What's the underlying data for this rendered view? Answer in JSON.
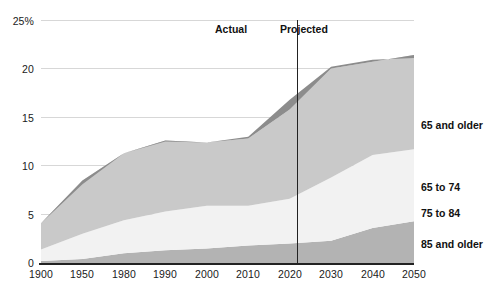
{
  "chart_data": {
    "type": "area",
    "title": "",
    "subtitle": "",
    "xlabel": "",
    "ylabel": "",
    "stacked": true,
    "grid": true,
    "legend_position": "right",
    "ylim": [
      0,
      25
    ],
    "yticks": [
      "0",
      "5",
      "10",
      "15",
      "20",
      "25%"
    ],
    "ytick_values": [
      0,
      5,
      10,
      15,
      20,
      25
    ],
    "categories": [
      "1900",
      "1950",
      "1980",
      "1990",
      "2000",
      "2010",
      "2020",
      "2030",
      "2040",
      "2050"
    ],
    "series": [
      {
        "name": "85 and older",
        "color": "#b3b3b3",
        "values": [
          0.2,
          0.4,
          1.0,
          1.3,
          1.5,
          1.8,
          2.0,
          2.3,
          3.6,
          4.3
        ]
      },
      {
        "name": "75 to 84",
        "color": "#f2f2f2",
        "values": [
          1.2,
          2.6,
          3.4,
          4.0,
          4.4,
          4.1,
          4.6,
          6.5,
          7.5,
          7.4
        ]
      },
      {
        "name": "65 to 74",
        "color": "#c9c9c9",
        "values": [
          2.7,
          5.5,
          6.9,
          7.3,
          6.5,
          6.9,
          9.2,
          11.2,
          9.6,
          9.7
        ]
      },
      {
        "name": "65 and older",
        "color": "#8c8c8c",
        "values": [
          4.1,
          8.1,
          11.3,
          12.5,
          12.4,
          13.0,
          16.8,
          20.2,
          20.9,
          21.1
        ]
      }
    ],
    "annotations": [
      {
        "name": "actual",
        "label": "Actual",
        "x_value": "2015",
        "side": "left"
      },
      {
        "name": "projected",
        "label": "Projected",
        "x_value": "2015",
        "side": "right"
      }
    ],
    "divider": {
      "label": "",
      "at_category_fraction": 6.2
    },
    "legend_entries": [
      {
        "label": "65 and older",
        "color": "#8c8c8c"
      },
      {
        "label": "65 to 74",
        "color": "#c9c9c9"
      },
      {
        "label": "75 to 84",
        "color": "#f2f2f2"
      },
      {
        "label": "85 and older",
        "color": "#b3b3b3"
      }
    ]
  },
  "colors": {
    "band_total_65_plus": "#8c8c8c",
    "band_65_74": "#c9c9c9",
    "band_75_84": "#f2f2f2",
    "band_85_plus": "#b3b3b3",
    "gridline": "#d7d7d7",
    "axis": "#222222",
    "text": "#111111"
  }
}
